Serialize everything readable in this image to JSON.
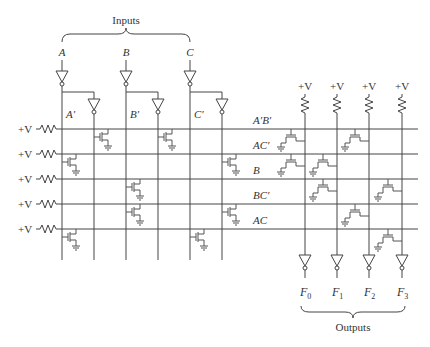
{
  "title_inputs": "Inputs",
  "title_outputs": "Outputs",
  "supply_label": "+V",
  "inputs": [
    "A",
    "B",
    "C"
  ],
  "complements": [
    "A′",
    "B′",
    "C′"
  ],
  "terms": [
    "A′B′",
    "AC′",
    "B",
    "BC′",
    "AC"
  ],
  "outputs": {
    "F0": "F",
    "F0_sub": "0",
    "F1": "F",
    "F1_sub": "1",
    "F2": "F",
    "F2_sub": "2",
    "F3": "F",
    "F3_sub": "3"
  },
  "and_plane": {
    "rows": [
      "A′B′",
      "AC′",
      "B",
      "BC′",
      "AC"
    ],
    "columns": [
      "A′",
      "A",
      "B′",
      "B",
      "C′",
      "C"
    ],
    "connections": [
      [
        0,
        2
      ],
      [
        1,
        4
      ],
      [
        3
      ],
      [
        3,
        4
      ],
      [
        1,
        5
      ]
    ]
  },
  "or_plane": {
    "outputs": [
      "F0",
      "F1",
      "F2",
      "F3"
    ],
    "connections": [
      [
        0,
        1
      ],
      [
        1,
        3
      ],
      [
        0,
        2
      ],
      [
        4
      ],
      [
        3
      ]
    ]
  },
  "icons": [
    "resistor-icon",
    "inverter-icon",
    "nmos-transistor-icon",
    "ground-icon",
    "brace-icon"
  ]
}
